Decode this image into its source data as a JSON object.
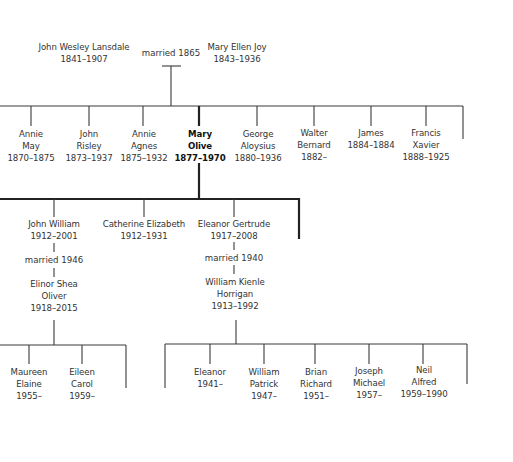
{
  "diagram": {
    "type": "family-tree",
    "generation1": {
      "father": {
        "name": "John Wesley Lansdale",
        "dates": "1841–1907"
      },
      "marriage": "married 1865",
      "mother": {
        "name": "Mary Ellen Joy",
        "dates": "1843–1936"
      }
    },
    "generation2": [
      {
        "line1": "Annie",
        "line2": "May",
        "dates": "1870–1875"
      },
      {
        "line1": "John",
        "line2": "Risley",
        "dates": "1873–1937"
      },
      {
        "line1": "Annie",
        "line2": "Agnes",
        "dates": "1875–1932"
      },
      {
        "line1": "Mary",
        "line2": "Olive",
        "dates": "1877–1970",
        "highlighted": true
      },
      {
        "line1": "George",
        "line2": "Aloysius",
        "dates": "1880–1936"
      },
      {
        "line1": "Walter",
        "line2": "Bernard",
        "dates": "1882–"
      },
      {
        "line1": "James",
        "line2": "",
        "dates": "1884–1884"
      },
      {
        "line1": "Francis",
        "line2": "Xavier",
        "dates": "1888–1925"
      }
    ],
    "generation3": [
      {
        "name": "John William",
        "dates": "1912–2001",
        "marriage": "married 1946",
        "spouse": {
          "line1": "Elinor Shea",
          "line2": "Oliver",
          "dates": "1918–2015"
        }
      },
      {
        "name": "Catherine Elizabeth",
        "dates": "1912–1931"
      },
      {
        "name": "Eleanor Gertrude",
        "dates": "1917–2008",
        "marriage": "married 1940",
        "spouse": {
          "line1": "William Kienle",
          "line2": "Horrigan",
          "dates": "1913–1992"
        }
      }
    ],
    "generation4_left": [
      {
        "line1": "Maureen",
        "line2": "Elaine",
        "dates": "1955–"
      },
      {
        "line1": "Eileen",
        "line2": "Carol",
        "dates": "1959–"
      }
    ],
    "generation4_right": [
      {
        "line1": "Eleanor",
        "line2": "",
        "dates": "1941–"
      },
      {
        "line1": "William",
        "line2": "Patrick",
        "dates": "1947–"
      },
      {
        "line1": "Brian",
        "line2": "Richard",
        "dates": "1951–"
      },
      {
        "line1": "Joseph",
        "line2": "Michael",
        "dates": "1957–"
      },
      {
        "line1": "Neil",
        "line2": "Alfred",
        "dates": "1959–1990"
      }
    ],
    "colors": {
      "line": "#3a3a3a",
      "text": "#333333",
      "background": "#ffffff"
    }
  }
}
